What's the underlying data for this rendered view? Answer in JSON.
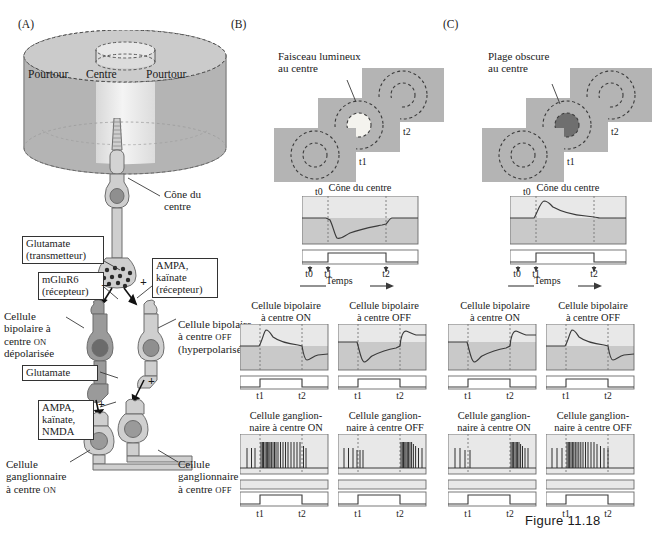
{
  "figure": {
    "caption": "Figure 11.18"
  },
  "panelA": {
    "letter": "(A)",
    "receptive_field": {
      "surround_left": "Pourtour",
      "center": "Centre",
      "surround_right": "Pourtour"
    },
    "labels": {
      "cone": "Cône du\ncentre",
      "glutamate_transmitter_l1": "Glutamate",
      "glutamate_transmitter_l2": "(transmetteur)",
      "mglur6_l1": "mGluR6",
      "mglur6_l2": "(récepteur)",
      "ampa_kainate_l1": "AMPA,",
      "ampa_kainate_l2": "kaïnate",
      "ampa_kainate_l3": "(récepteur)",
      "bipolar_on_l1": "Cellule",
      "bipolar_on_l2": "bipolaire à",
      "bipolar_on_l3": "centre ON",
      "bipolar_on_l4": "dépolarisée",
      "bipolar_off_l1": "Cellule bipolaire",
      "bipolar_off_l2": "à centre OFF",
      "bipolar_off_l3": "(hyperpolarisée)",
      "glutamate2": "Glutamate",
      "ampa_kainate_nmda_l1": "AMPA,",
      "ampa_kainate_nmda_l2": "kaïnate,",
      "ampa_kainate_nmda_l3": "NMDA",
      "ganglion_on_l1": "Cellule",
      "ganglion_on_l2": "ganglionnaire",
      "ganglion_on_l3": "à centre ON",
      "ganglion_off_l1": "Cellule",
      "ganglion_off_l2": "ganglionnaire",
      "ganglion_off_l3": "à centre OFF",
      "sign_minus": "–",
      "sign_plus": "+"
    }
  },
  "panelB": {
    "letter": "(B)",
    "stimulus": {
      "title_l1": "Faisceau lumineux",
      "title_l2": "au centre",
      "frames": [
        "t0",
        "t1",
        "t2"
      ],
      "spot_color": "#f2f1ec"
    },
    "cone": {
      "title": "Cône du centre",
      "ticks": [
        "t0",
        "t1",
        "t2"
      ],
      "axis_label": "Temps"
    },
    "bipolar_on": {
      "title_l1": "Cellule bipolaire",
      "title_l2": "à centre ON",
      "ticks": [
        "t1",
        "t2"
      ]
    },
    "bipolar_off": {
      "title_l1": "Cellule bipolaire",
      "title_l2": "à centre OFF",
      "ticks": [
        "t1",
        "t2"
      ]
    },
    "ganglion_on": {
      "title_l1": "Cellule ganglion-",
      "title_l2": "naire à centre ON",
      "ticks": [
        "t1",
        "t2"
      ]
    },
    "ganglion_off": {
      "title_l1": "Cellule ganglion-",
      "title_l2": "naire à centre OFF",
      "ticks": [
        "t1",
        "t2"
      ]
    }
  },
  "panelC": {
    "letter": "(C)",
    "stimulus": {
      "title_l1": "Plage obscure",
      "title_l2": "au centre",
      "frames": [
        "t0",
        "t1",
        "t2"
      ],
      "spot_color": "#6f6f6f"
    },
    "cone": {
      "title": "Cône du centre",
      "ticks": [
        "t0",
        "t1",
        "t2"
      ],
      "axis_label": "Temps"
    },
    "bipolar_on": {
      "title_l1": "Cellule  bipolaire",
      "title_l2": "à centre ON",
      "ticks": [
        "t1",
        "t2"
      ]
    },
    "bipolar_off": {
      "title_l1": "Cellule bipolaire",
      "title_l2": "à centre OFF",
      "ticks": [
        "t1",
        "t2"
      ]
    },
    "ganglion_on": {
      "title_l1": "Cellule ganglion-",
      "title_l2": "naire à centre ON",
      "ticks": [
        "t1",
        "t2"
      ]
    },
    "ganglion_off": {
      "title_l1": "Cellule ganglion-",
      "title_l2": "naire à centre OFF",
      "ticks": [
        "t1",
        "t2"
      ]
    }
  },
  "chart_data": {
    "type": "line",
    "xlabel": "Temps",
    "ylabel": "Membrane potential / spike rate",
    "x_events": {
      "t0": 0.0,
      "t1": 0.22,
      "t2": 0.72
    },
    "stimulus_bar": {
      "on_at": "t1",
      "off_at": "t2"
    },
    "traces": [
      {
        "panel": "B",
        "cell": "Cône du centre",
        "polarity": "hyperpolarizing",
        "points": [
          [
            0,
            0.52
          ],
          [
            0.2,
            0.52
          ],
          [
            0.24,
            0.5
          ],
          [
            0.3,
            0.13
          ],
          [
            0.36,
            0.2
          ],
          [
            0.5,
            0.31
          ],
          [
            0.68,
            0.38
          ],
          [
            0.72,
            0.4
          ],
          [
            0.76,
            0.52
          ],
          [
            1,
            0.52
          ]
        ]
      },
      {
        "panel": "B",
        "cell": "Cellule bipolaire à centre ON",
        "polarity": "depolarizing",
        "points": [
          [
            0,
            0.48
          ],
          [
            0.22,
            0.48
          ],
          [
            0.28,
            0.86
          ],
          [
            0.34,
            0.8
          ],
          [
            0.5,
            0.66
          ],
          [
            0.7,
            0.58
          ],
          [
            0.74,
            0.3
          ],
          [
            0.8,
            0.24
          ],
          [
            0.9,
            0.33
          ],
          [
            1,
            0.35
          ]
        ]
      },
      {
        "panel": "B",
        "cell": "Cellule bipolaire à centre OFF",
        "polarity": "hyperpolarizing",
        "points": [
          [
            0,
            0.62
          ],
          [
            0.22,
            0.62
          ],
          [
            0.27,
            0.2
          ],
          [
            0.33,
            0.14
          ],
          [
            0.5,
            0.3
          ],
          [
            0.7,
            0.4
          ],
          [
            0.75,
            0.78
          ],
          [
            0.82,
            0.72
          ],
          [
            1,
            0.74
          ]
        ]
      },
      {
        "panel": "C",
        "cell": "Cône du centre",
        "polarity": "depolarizing",
        "points": [
          [
            0,
            0.47
          ],
          [
            0.2,
            0.47
          ],
          [
            0.26,
            0.85
          ],
          [
            0.32,
            0.88
          ],
          [
            0.45,
            0.74
          ],
          [
            0.65,
            0.64
          ],
          [
            0.71,
            0.62
          ],
          [
            0.75,
            0.47
          ],
          [
            1,
            0.47
          ]
        ]
      },
      {
        "panel": "C",
        "cell": "Cellule bipolaire à centre ON",
        "polarity": "hyperpolarizing",
        "points": [
          [
            0,
            0.62
          ],
          [
            0.22,
            0.62
          ],
          [
            0.27,
            0.2
          ],
          [
            0.33,
            0.15
          ],
          [
            0.5,
            0.3
          ],
          [
            0.7,
            0.4
          ],
          [
            0.75,
            0.8
          ],
          [
            0.82,
            0.72
          ],
          [
            1,
            0.74
          ]
        ]
      },
      {
        "panel": "C",
        "cell": "Cellule bipolaire à centre OFF",
        "polarity": "depolarizing",
        "points": [
          [
            0,
            0.48
          ],
          [
            0.22,
            0.48
          ],
          [
            0.28,
            0.86
          ],
          [
            0.34,
            0.8
          ],
          [
            0.5,
            0.66
          ],
          [
            0.7,
            0.58
          ],
          [
            0.74,
            0.28
          ],
          [
            0.8,
            0.24
          ],
          [
            0.9,
            0.34
          ],
          [
            1,
            0.36
          ]
        ]
      }
    ],
    "spike_trains": [
      {
        "panel": "B",
        "cell": "Cellule ganglionnaire à centre ON",
        "description": "sparse baseline, dense burst between t1 and t2",
        "spikes": [
          0.08,
          0.13,
          0.17,
          0.235,
          0.25,
          0.262,
          0.275,
          0.29,
          0.3,
          0.312,
          0.325,
          0.337,
          0.35,
          0.362,
          0.375,
          0.39,
          0.405,
          0.425,
          0.45,
          0.47,
          0.5,
          0.53,
          0.56,
          0.59,
          0.62,
          0.65,
          0.68,
          0.7,
          0.735,
          0.76
        ]
      },
      {
        "panel": "B",
        "cell": "Cellule ganglionnaire à centre OFF",
        "description": "sparse baseline, dense burst after t2",
        "spikes": [
          0.07,
          0.12,
          0.17,
          0.215,
          0.245,
          0.28,
          0.72,
          0.733,
          0.744,
          0.755,
          0.766,
          0.777,
          0.788,
          0.8,
          0.815,
          0.835,
          0.86,
          0.895,
          0.93
        ]
      },
      {
        "panel": "C",
        "cell": "Cellule ganglionnaire à centre ON",
        "description": "sparse baseline, burst after t2",
        "spikes": [
          0.08,
          0.135,
          0.19,
          0.25,
          0.72,
          0.732,
          0.743,
          0.754,
          0.765,
          0.776,
          0.787,
          0.8,
          0.818,
          0.845,
          0.88
        ]
      },
      {
        "panel": "C",
        "cell": "Cellule ganglionnaire à centre OFF",
        "description": "dense burst between t1 and t2",
        "spikes": [
          0.07,
          0.12,
          0.175,
          0.235,
          0.25,
          0.263,
          0.276,
          0.29,
          0.303,
          0.316,
          0.33,
          0.345,
          0.36,
          0.378,
          0.4,
          0.425,
          0.45,
          0.478,
          0.51,
          0.545,
          0.58,
          0.615,
          0.65,
          0.69,
          0.72
        ]
      }
    ]
  },
  "colors": {
    "surround_gray": "#b4b4b4",
    "center_light": "#ececec",
    "cell_light": "#cfcfcf",
    "cell_dark": "#9a9a9a",
    "nucleus": "#7b7b7b",
    "plot_band_light": "#e6e6e6",
    "plot_band_dark": "#c9c9c9",
    "stim_panel": "#b4b4b4",
    "trace": "#3a3a3a"
  }
}
